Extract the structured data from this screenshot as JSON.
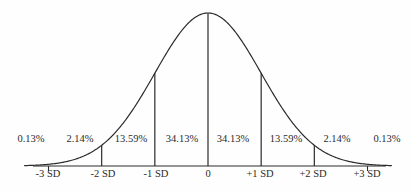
{
  "figure": {
    "background_color": "#fefefe",
    "stroke_color": "#2b2b2b",
    "text_color": "#2b2b2b"
  },
  "chart_data": {
    "type": "line",
    "title": "",
    "subtitle": "",
    "xlabel": "",
    "ylabel": "",
    "grid": false,
    "legend": "none",
    "curve": "standard normal probability density",
    "xlim": [
      -3.45,
      3.45
    ],
    "ylim": [
      0,
      0.4
    ],
    "x_tick_labels": [
      "-3 SD",
      "-2 SD",
      "-1 SD",
      "0",
      "+1 SD",
      "+2 SD",
      "+3 SD"
    ],
    "x_tick_values": [
      -3,
      -2,
      -1,
      0,
      1,
      2,
      3
    ],
    "vertical_dividers": [
      -2,
      -1,
      0,
      1,
      2
    ],
    "axis_ticks": [
      -3,
      3
    ],
    "region_labels": [
      "0.13%",
      "2.14%",
      "13.59%",
      "34.13%",
      "34.13%",
      "13.59%",
      "2.14%",
      "0.13%"
    ],
    "region_values": [
      0.13,
      2.14,
      13.59,
      34.13,
      34.13,
      13.59,
      2.14,
      0.13
    ],
    "region_centers_sd": [
      -3.5,
      -2.5,
      -1.5,
      -0.5,
      0.5,
      1.5,
      2.5,
      3.5
    ],
    "regions": [
      {
        "label": "0.13%",
        "value": 0.13,
        "from_sd": -4,
        "to_sd": -3,
        "center_px": 31
      },
      {
        "label": "2.14%",
        "value": 2.14,
        "from_sd": -3,
        "to_sd": -2,
        "center_px": 80
      },
      {
        "label": "13.59%",
        "value": 13.59,
        "from_sd": -2,
        "to_sd": -1,
        "center_px": 131
      },
      {
        "label": "34.13%",
        "value": 34.13,
        "from_sd": -1,
        "to_sd": 0,
        "center_px": 182
      },
      {
        "label": "34.13%",
        "value": 34.13,
        "from_sd": 0,
        "to_sd": 1,
        "center_px": 233
      },
      {
        "label": "13.59%",
        "value": 13.59,
        "from_sd": 1,
        "to_sd": 2,
        "center_px": 286
      },
      {
        "label": "2.14%",
        "value": 2.14,
        "from_sd": 2,
        "to_sd": 3,
        "center_px": 337
      },
      {
        "label": "0.13%",
        "value": 0.13,
        "from_sd": 3,
        "to_sd": 4,
        "center_px": 387
      }
    ],
    "ticks": [
      {
        "label": "-3 SD",
        "sd": -3,
        "x_px": 48
      },
      {
        "label": "-2 SD",
        "sd": -2,
        "x_px": 103
      },
      {
        "label": "-1 SD",
        "sd": -1,
        "x_px": 156
      },
      {
        "label": "0",
        "sd": 0,
        "x_px": 208
      },
      {
        "label": "+1 SD",
        "sd": 1,
        "x_px": 260
      },
      {
        "label": "+2 SD",
        "sd": 2,
        "x_px": 313
      },
      {
        "label": "+3 SD",
        "sd": 3,
        "x_px": 367
      }
    ]
  }
}
